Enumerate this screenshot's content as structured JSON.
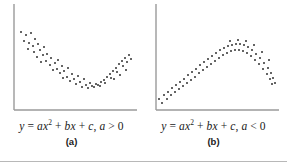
{
  "figure": {
    "bottom_rule_color": "#b8b8b8",
    "background_color": "#ffffff"
  },
  "panels": [
    {
      "id": "a",
      "label": "(a)",
      "equation_plain": "y = ax2 + bx + c, a > 0",
      "eq_y": "y",
      "eq_eq": "=",
      "eq_a": "a",
      "eq_x": "x",
      "eq_sup": "2",
      "eq_plus1": "+",
      "eq_b": "b",
      "eq_x2": "x",
      "eq_plus2": "+",
      "eq_c": "c",
      "eq_comma": ",",
      "eq_a2": "a",
      "eq_rel": ">",
      "eq_zero": "0",
      "axis_color": "#9a9a9a",
      "dot_color": "#2b2b2b"
    },
    {
      "id": "b",
      "label": "(b)",
      "equation_plain": "y = ax2 + bx + c, a < 0",
      "eq_y": "y",
      "eq_eq": "=",
      "eq_a": "a",
      "eq_x": "x",
      "eq_sup": "2",
      "eq_plus1": "+",
      "eq_b": "b",
      "eq_x2": "x",
      "eq_plus2": "+",
      "eq_c": "c",
      "eq_comma": ",",
      "eq_a2": "a",
      "eq_rel": "<",
      "eq_zero": "0",
      "axis_color": "#9a9a9a",
      "dot_color": "#2b2b2b"
    }
  ],
  "chart_data": [
    {
      "type": "scatter",
      "title": "y = ax2 + bx + c, a > 0",
      "panel": "(a)",
      "xlabel": "",
      "ylabel": "",
      "grid": false,
      "legend": "none",
      "axes": "L-shaped left and bottom spines only, no tick labels",
      "shape": "convex upward parabola (U-shaped), minimum near middle-right of x range",
      "xlim": [
        0,
        143
      ],
      "ylim": [
        0,
        119
      ],
      "points": [
        [
          21,
          32
        ],
        [
          26,
          35
        ],
        [
          31,
          33
        ],
        [
          24,
          41
        ],
        [
          29,
          43
        ],
        [
          35,
          39
        ],
        [
          33,
          46
        ],
        [
          38,
          44
        ],
        [
          28,
          49
        ],
        [
          34,
          52
        ],
        [
          40,
          50
        ],
        [
          44,
          47
        ],
        [
          37,
          57
        ],
        [
          43,
          55
        ],
        [
          47,
          54
        ],
        [
          41,
          62
        ],
        [
          46,
          61
        ],
        [
          51,
          58
        ],
        [
          50,
          65
        ],
        [
          55,
          63
        ],
        [
          58,
          60
        ],
        [
          53,
          70
        ],
        [
          57,
          69
        ],
        [
          62,
          66
        ],
        [
          60,
          73
        ],
        [
          64,
          71
        ],
        [
          68,
          68
        ],
        [
          63,
          78
        ],
        [
          67,
          77
        ],
        [
          72,
          74
        ],
        [
          70,
          81
        ],
        [
          74,
          79
        ],
        [
          78,
          76
        ],
        [
          76,
          84
        ],
        [
          80,
          82
        ],
        [
          84,
          79
        ],
        [
          82,
          87
        ],
        [
          86,
          85
        ],
        [
          90,
          83
        ],
        [
          88,
          88
        ],
        [
          92,
          86
        ],
        [
          96,
          84
        ],
        [
          94,
          87
        ],
        [
          98,
          85
        ],
        [
          101,
          82
        ],
        [
          100,
          86
        ],
        [
          104,
          80
        ],
        [
          107,
          77
        ],
        [
          105,
          83
        ],
        [
          110,
          74
        ],
        [
          113,
          71
        ],
        [
          111,
          78
        ],
        [
          116,
          68
        ],
        [
          119,
          64
        ],
        [
          117,
          72
        ],
        [
          122,
          61
        ],
        [
          125,
          58
        ],
        [
          123,
          66
        ],
        [
          127,
          62
        ],
        [
          129,
          55
        ],
        [
          131,
          59
        ],
        [
          126,
          70
        ],
        [
          120,
          75
        ],
        [
          114,
          79
        ]
      ]
    },
    {
      "type": "scatter",
      "title": "y = ax2 + bx + c, a < 0",
      "panel": "(b)",
      "xlabel": "",
      "ylabel": "",
      "grid": false,
      "legend": "none",
      "axes": "L-shaped left and bottom spines only, no tick labels",
      "shape": "concave downward parabola (inverted U), maximum near middle-right of x range",
      "xlim": [
        0,
        143
      ],
      "ylim": [
        0,
        119
      ],
      "points": [
        [
          17,
          99
        ],
        [
          22,
          95
        ],
        [
          20,
          103
        ],
        [
          26,
          92
        ],
        [
          25,
          99
        ],
        [
          30,
          88
        ],
        [
          29,
          95
        ],
        [
          34,
          85
        ],
        [
          33,
          92
        ],
        [
          38,
          82
        ],
        [
          37,
          89
        ],
        [
          42,
          79
        ],
        [
          41,
          86
        ],
        [
          46,
          75
        ],
        [
          45,
          83
        ],
        [
          50,
          72
        ],
        [
          49,
          80
        ],
        [
          54,
          69
        ],
        [
          53,
          77
        ],
        [
          58,
          65
        ],
        [
          57,
          73
        ],
        [
          62,
          62
        ],
        [
          61,
          70
        ],
        [
          66,
          59
        ],
        [
          65,
          67
        ],
        [
          70,
          56
        ],
        [
          69,
          64
        ],
        [
          74,
          53
        ],
        [
          73,
          61
        ],
        [
          78,
          50
        ],
        [
          77,
          58
        ],
        [
          82,
          48
        ],
        [
          81,
          55
        ],
        [
          86,
          46
        ],
        [
          85,
          53
        ],
        [
          90,
          45
        ],
        [
          89,
          51
        ],
        [
          94,
          44
        ],
        [
          93,
          50
        ],
        [
          98,
          44
        ],
        [
          97,
          50
        ],
        [
          102,
          45
        ],
        [
          101,
          51
        ],
        [
          106,
          47
        ],
        [
          105,
          53
        ],
        [
          110,
          50
        ],
        [
          109,
          56
        ],
        [
          114,
          54
        ],
        [
          113,
          60
        ],
        [
          118,
          58
        ],
        [
          117,
          64
        ],
        [
          122,
          63
        ],
        [
          121,
          69
        ],
        [
          126,
          68
        ],
        [
          125,
          74
        ],
        [
          129,
          73
        ],
        [
          128,
          79
        ],
        [
          131,
          78
        ],
        [
          130,
          84
        ],
        [
          133,
          83
        ],
        [
          88,
          41
        ],
        [
          96,
          40
        ],
        [
          104,
          41
        ],
        [
          112,
          45
        ],
        [
          120,
          52
        ],
        [
          127,
          60
        ]
      ]
    }
  ]
}
